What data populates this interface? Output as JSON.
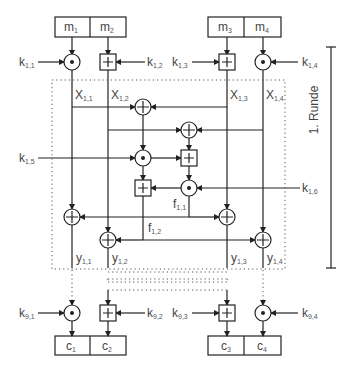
{
  "inputs": [
    {
      "base": "m",
      "sub": "1"
    },
    {
      "base": "m",
      "sub": "2"
    },
    {
      "base": "m",
      "sub": "3"
    },
    {
      "base": "m",
      "sub": "4"
    }
  ],
  "outputs": [
    {
      "base": "c",
      "sub": "1"
    },
    {
      "base": "c",
      "sub": "2"
    },
    {
      "base": "c",
      "sub": "3"
    },
    {
      "base": "c",
      "sub": "4"
    }
  ],
  "round_keys": {
    "k11": {
      "base": "k",
      "sub": "1,1"
    },
    "k12": {
      "base": "k",
      "sub": "1,2"
    },
    "k13": {
      "base": "k",
      "sub": "1,3"
    },
    "k14": {
      "base": "k",
      "sub": "1,4"
    },
    "k15": {
      "base": "k",
      "sub": "1,5"
    },
    "k16": {
      "base": "k",
      "sub": "1,6"
    }
  },
  "output_keys": {
    "k91": {
      "base": "k",
      "sub": "9,1"
    },
    "k92": {
      "base": "k",
      "sub": "9,2"
    },
    "k93": {
      "base": "k",
      "sub": "9,3"
    },
    "k94": {
      "base": "k",
      "sub": "9,4"
    }
  },
  "intermediates": {
    "x11": {
      "base": "X",
      "sub": "1,1"
    },
    "x12": {
      "base": "X",
      "sub": "1,2"
    },
    "x13": {
      "base": "X",
      "sub": "1,3"
    },
    "x14": {
      "base": "X",
      "sub": "1,4"
    },
    "f11": {
      "base": "f",
      "sub": "1,1"
    },
    "f12": {
      "base": "f",
      "sub": "1,2"
    },
    "y11": {
      "base": "y",
      "sub": "1,1"
    },
    "y12": {
      "base": "y",
      "sub": "1,2"
    },
    "y13": {
      "base": "y",
      "sub": "1,3"
    },
    "y14": {
      "base": "y",
      "sub": "1,4"
    }
  },
  "round_label": "1. Runde",
  "operators": {
    "multiply": "multiplication modulo 2^16+1 (circle-dot)",
    "add": "addition modulo 2^16 (boxed plus)",
    "xor": "bitwise XOR (circled plus)"
  },
  "colors": {
    "line": "#222222",
    "text": "#444444",
    "dotted": "#666666"
  }
}
